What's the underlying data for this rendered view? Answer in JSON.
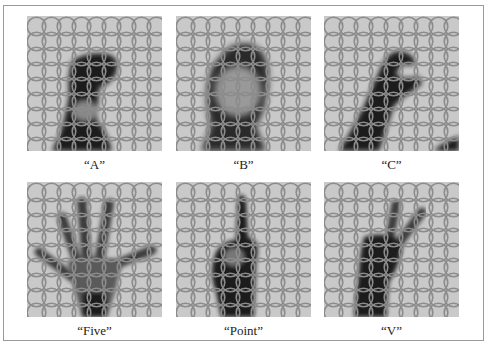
{
  "figure": {
    "panels": [
      {
        "id": "A",
        "label": "“A”",
        "gesture": "A"
      },
      {
        "id": "B",
        "label": "“B”",
        "gesture": "B"
      },
      {
        "id": "C",
        "label": "“C”",
        "gesture": "C"
      },
      {
        "id": "Five",
        "label": "“Five”",
        "gesture": "Five"
      },
      {
        "id": "Point",
        "label": "“Point”",
        "gesture": "Point"
      },
      {
        "id": "V",
        "label": "“V”",
        "gesture": "V"
      }
    ],
    "grid": {
      "rows": 9,
      "cols": 9,
      "ring_color": "#8c8c8c",
      "background": "#c9c9c9",
      "hand_color": "#1a1a1a"
    }
  }
}
